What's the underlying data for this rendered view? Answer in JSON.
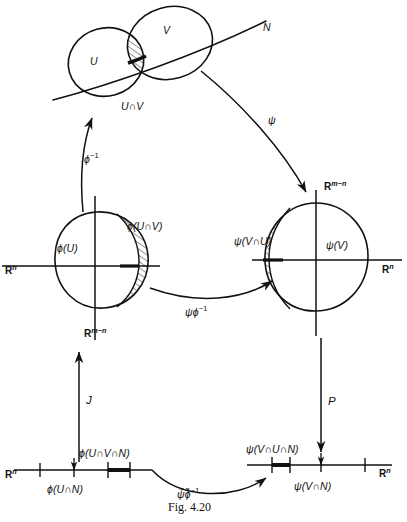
{
  "figure": {
    "caption_prefix": "F",
    "caption_smallcaps": "IG.",
    "caption_number": "4.20",
    "caption_full": "Fig. 4.20",
    "ink_color": "#111111",
    "background_color": "#ffffff"
  },
  "manifold": {
    "line_label": "N",
    "chart_u_label": "U",
    "chart_v_label": "V",
    "intersection_label": "U∩V"
  },
  "maps": {
    "phi_inverse": "ϕ",
    "phi_inverse_exp": "−1",
    "psi": "ψ",
    "psi_phi_inverse_base": "ψϕ",
    "psi_phi_inverse_exp": "−1",
    "j": "J",
    "p": "P",
    "bottom_transition_base": "ψ̃ϕ̃",
    "bottom_transition_exp": "−1"
  },
  "left_chart": {
    "image_label": "ϕ(U)",
    "hatched_label": "ϕ(U∩V)",
    "axis_horizontal": "R",
    "axis_horizontal_exp": "n",
    "axis_vertical": "R",
    "axis_vertical_exp": "m−n"
  },
  "right_chart": {
    "image_label": "ψ(V)",
    "hatched_label": "ψ(V∩U)",
    "axis_horizontal": "R",
    "axis_horizontal_exp": "n",
    "axis_vertical": "R",
    "axis_vertical_exp": "m−n"
  },
  "bottom_left_line": {
    "axis_label": "R",
    "axis_label_exp": "n",
    "segment_label": "ϕ(U∩V∩N)",
    "point_label": "ϕ(U∩N)"
  },
  "bottom_right_line": {
    "axis_label": "R",
    "axis_label_exp": "n",
    "segment_label": "ψ(V∩U∩N)",
    "point_label": "ψ(V∩N)"
  }
}
